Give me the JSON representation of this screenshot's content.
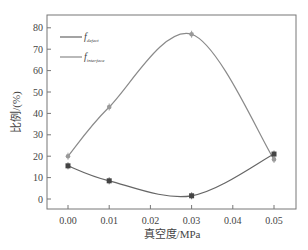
{
  "chart_data": {
    "type": "line",
    "title": "",
    "xlabel": "真空度/MPa",
    "ylabel": "比例/(%)",
    "x": [
      0.0,
      0.01,
      0.03,
      0.05
    ],
    "xticks": [
      "0.00",
      "0.01",
      "0.02",
      "0.03",
      "0.04",
      "0.05"
    ],
    "yticks": [
      "0",
      "10",
      "20",
      "30",
      "40",
      "50",
      "60",
      "70",
      "80"
    ],
    "xlim": [
      -0.005,
      0.055
    ],
    "ylim": [
      -5,
      84
    ],
    "grid": false,
    "legend_position": "upper-left",
    "series": [
      {
        "name": "f_defect",
        "label_main": "f",
        "label_sub": "defect",
        "values": [
          15.5,
          8.5,
          1.5,
          21
        ],
        "marker": "square",
        "color": "#555555"
      },
      {
        "name": "f_interface",
        "label_main": "f",
        "label_sub": "interface",
        "values": [
          20,
          43,
          77,
          18.5
        ],
        "marker": "circle",
        "color": "#888888"
      }
    ]
  }
}
